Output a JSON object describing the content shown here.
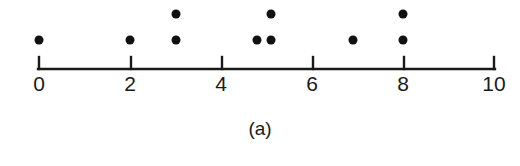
{
  "caption": "(a)",
  "chart_data": {
    "type": "scatter",
    "subtype": "dotplot",
    "title": "",
    "subtitle": "",
    "xlabel": "",
    "ylabel": "",
    "caption": "(a)",
    "grid": false,
    "legend": false,
    "xlim": [
      0,
      10
    ],
    "tick_labels": [
      "0",
      "2",
      "4",
      "6",
      "8",
      "10"
    ],
    "tick_values": [
      0,
      2,
      4,
      6,
      8,
      10
    ],
    "minor_ticks": false,
    "values": [
      0,
      2,
      3,
      3,
      4.8,
      5.1,
      5.1,
      6.9,
      8,
      8
    ],
    "n": 10,
    "stacks": [
      {
        "x": 0,
        "count": 1
      },
      {
        "x": 2,
        "count": 1
      },
      {
        "x": 3,
        "count": 2
      },
      {
        "x": 4.8,
        "count": 1
      },
      {
        "x": 5.1,
        "count": 2
      },
      {
        "x": 6.9,
        "count": 1
      },
      {
        "x": 8,
        "count": 2
      }
    ],
    "points": [
      {
        "x": 0,
        "stack": 1
      },
      {
        "x": 2,
        "stack": 1
      },
      {
        "x": 3,
        "stack": 1
      },
      {
        "x": 3,
        "stack": 2
      },
      {
        "x": 4.8,
        "stack": 1
      },
      {
        "x": 5.1,
        "stack": 1
      },
      {
        "x": 5.1,
        "stack": 2
      },
      {
        "x": 6.9,
        "stack": 1
      },
      {
        "x": 8,
        "stack": 1
      },
      {
        "x": 8,
        "stack": 2
      }
    ],
    "colors": {
      "dot": "#111111",
      "axis": "#1a1a1a",
      "text": "#1a1a1a",
      "background": "#ffffff"
    }
  }
}
